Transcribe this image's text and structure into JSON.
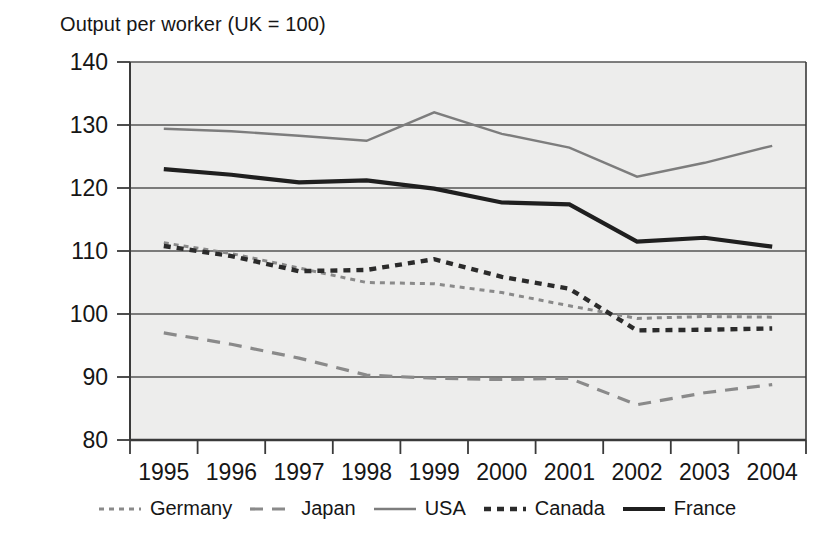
{
  "chart_data": {
    "type": "line",
    "title": "Output per worker (UK = 100)",
    "xlabel": "",
    "ylabel": "",
    "ylim": [
      80,
      140
    ],
    "ytick_step": 10,
    "yticks": [
      80,
      90,
      100,
      110,
      120,
      130,
      140
    ],
    "grid": true,
    "legend_position": "bottom",
    "x": [
      "1995",
      "1996",
      "1997",
      "1998",
      "1999",
      "2000",
      "2001",
      "2002",
      "2003",
      "2004"
    ],
    "categories": [
      "1995",
      "1996",
      "1997",
      "1998",
      "1999",
      "2000",
      "2001",
      "2002",
      "2003",
      "2004"
    ],
    "series": [
      {
        "name": "Germany",
        "style": "dotted",
        "color": "#8a8a8a",
        "values": [
          111.3,
          109.6,
          107.3,
          105.0,
          104.8,
          103.4,
          101.3,
          99.3,
          99.6,
          99.5
        ]
      },
      {
        "name": "Japan",
        "style": "dashed",
        "color": "#8a8a8a",
        "values": [
          97.0,
          95.2,
          93.0,
          90.3,
          89.8,
          89.6,
          89.8,
          85.6,
          87.5,
          88.8
        ]
      },
      {
        "name": "USA",
        "style": "solid",
        "color": "#7d7d7d",
        "values": [
          129.4,
          129.0,
          128.3,
          127.5,
          132.0,
          128.6,
          126.4,
          121.8,
          124.0,
          126.7
        ]
      },
      {
        "name": "Canada",
        "style": "dotted-bold",
        "color": "#2b2b2b",
        "values": [
          110.8,
          109.2,
          106.8,
          107.0,
          108.7,
          105.9,
          104.0,
          97.4,
          97.5,
          97.7
        ]
      },
      {
        "name": "France",
        "style": "solid-bold",
        "color": "#1f1f1f",
        "values": [
          123.0,
          122.1,
          120.9,
          121.2,
          119.9,
          117.7,
          117.4,
          111.5,
          112.1,
          110.7
        ]
      }
    ]
  },
  "legend": {
    "items": [
      {
        "label": "Germany"
      },
      {
        "label": "Japan"
      },
      {
        "label": "USA"
      },
      {
        "label": "Canada"
      },
      {
        "label": "France"
      }
    ]
  },
  "axis": {
    "y_labels": [
      "140",
      "130",
      "120",
      "110",
      "100",
      "90",
      "80"
    ],
    "x_labels": [
      "1995",
      "1996",
      "1997",
      "1998",
      "1999",
      "2000",
      "2001",
      "2002",
      "2003",
      "2004"
    ]
  },
  "colors": {
    "plot_background": "#ededec",
    "gridline": "#555555",
    "axis": "#3a3a3a",
    "text": "#161616"
  }
}
